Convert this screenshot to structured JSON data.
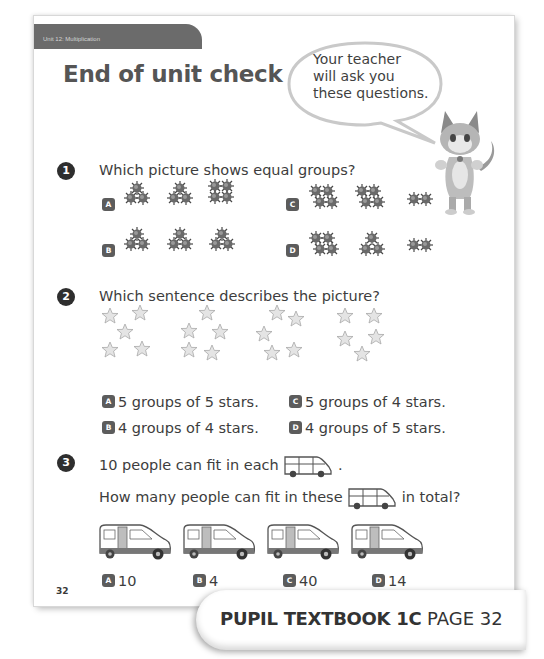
{
  "header": {
    "unit_label": "Unit 12: Multiplication",
    "title": "End of unit check"
  },
  "speech_bubble": {
    "lines": [
      "Your teacher",
      "will ask you",
      "these questions."
    ]
  },
  "mascot": {
    "icon": "fox-mascot-icon"
  },
  "questions": [
    {
      "number": "1",
      "text": "Which picture shows equal groups?",
      "options": [
        {
          "letter": "A",
          "groups": [
            3,
            3,
            4
          ]
        },
        {
          "letter": "B",
          "groups": [
            3,
            3,
            3
          ]
        },
        {
          "letter": "C",
          "groups": [
            4,
            4,
            2
          ]
        },
        {
          "letter": "D",
          "groups": [
            4,
            3,
            2
          ]
        }
      ]
    },
    {
      "number": "2",
      "text": "Which sentence describes the picture?",
      "star_groups": [
        5,
        5,
        5,
        5
      ],
      "options": [
        {
          "letter": "A",
          "text": "5 groups of 5 stars."
        },
        {
          "letter": "B",
          "text": "4 groups of 4 stars."
        },
        {
          "letter": "C",
          "text": "5 groups of 4 stars."
        },
        {
          "letter": "D",
          "text": "4 groups of 5 stars."
        }
      ]
    },
    {
      "number": "3",
      "line1_before": "10 people can fit in each",
      "line1_after": ".",
      "line2_before": "How many people can fit in these",
      "line2_after": "in total?",
      "van_count": 4,
      "options": [
        {
          "letter": "A",
          "text": "10"
        },
        {
          "letter": "B",
          "text": "4"
        },
        {
          "letter": "C",
          "text": "40"
        },
        {
          "letter": "D",
          "text": "14"
        }
      ]
    }
  ],
  "footer": {
    "page_number": "32",
    "reference_bold": "PUPIL TEXTBOOK 1C",
    "reference_page": "PAGE 32"
  }
}
